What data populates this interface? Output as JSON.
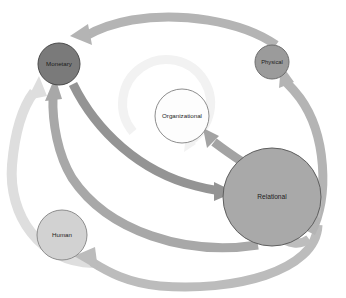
{
  "diagram": {
    "type": "node-link-diagram",
    "background_color": "#ffffff",
    "nodes": [
      {
        "id": "monetary",
        "label": "Monetary",
        "cx": 59,
        "cy": 64,
        "r": 21,
        "fill": "#7a7a7a",
        "stroke": "#4a4a4a",
        "font_size": 6.2,
        "text_fill": "#151515"
      },
      {
        "id": "physical",
        "label": "Physical",
        "cx": 272,
        "cy": 62,
        "r": 17,
        "fill": "#9b9b9b",
        "stroke": "#6e6e6e",
        "font_size": 5.8,
        "text_fill": "#1c1c1c"
      },
      {
        "id": "organizational",
        "label": "Organizational",
        "cx": 182,
        "cy": 116,
        "r": 27,
        "fill": "#fdfdfd",
        "stroke": "#8d8d8d",
        "font_size": 6.2,
        "text_fill": "#1c1c1c"
      },
      {
        "id": "relational",
        "label": "Relational",
        "cx": 272,
        "cy": 197,
        "r": 49,
        "fill": "#a9a9a9",
        "stroke": "#5f5f5f",
        "font_size": 6.6,
        "text_fill": "#1c1c1c"
      },
      {
        "id": "human",
        "label": "Human",
        "cx": 62,
        "cy": 235,
        "r": 25,
        "fill": "#d2d2d2",
        "stroke": "#8d8d8d",
        "font_size": 6.2,
        "text_fill": "#1c1c1c"
      }
    ],
    "edges": [
      {
        "id": "physical-to-monetary",
        "from": "physical",
        "to": "monetary",
        "color": "#b4b4b4",
        "width": 9
      },
      {
        "id": "relational-to-physical",
        "from": "relational",
        "to": "physical",
        "color": "#b4b4b4",
        "width": 9
      },
      {
        "id": "relational-to-organizational",
        "from": "relational",
        "to": "organizational",
        "color": "#a3a3a3",
        "width": 9
      },
      {
        "id": "monetary-to-relational",
        "from": "monetary",
        "to": "relational",
        "color": "#949494",
        "width": 9
      },
      {
        "id": "relational-to-monetary",
        "from": "relational",
        "to": "monetary",
        "color": "#a8a8a8",
        "width": 9
      },
      {
        "id": "human-to-monetary",
        "from": "human",
        "to": "monetary",
        "color": "#dedede",
        "width": 10
      },
      {
        "id": "relational-to-human",
        "from": "relational",
        "to": "human",
        "color": "#bcbcbc",
        "width": 9
      },
      {
        "id": "relational-self-loop",
        "from": "relational",
        "to": "relational",
        "color": "#bdbdbd",
        "width": 9
      },
      {
        "id": "organizational-self-loop",
        "from": "organizational",
        "to": "organizational",
        "color": "#f2f2f2",
        "width": 9
      }
    ]
  }
}
